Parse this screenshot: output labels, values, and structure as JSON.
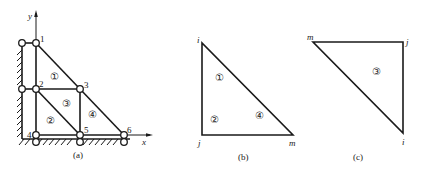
{
  "figure": {
    "panels": [
      {
        "id": "a",
        "caption": "(a)",
        "axes": {
          "x_label": "x",
          "y_label": "y"
        },
        "nodes": [
          {
            "label": "1",
            "x": 36,
            "y": 43
          },
          {
            "label": "2",
            "x": 36,
            "y": 89
          },
          {
            "label": "3",
            "x": 80,
            "y": 89
          },
          {
            "label": "4",
            "x": 36,
            "y": 135
          },
          {
            "label": "5",
            "x": 80,
            "y": 135
          },
          {
            "label": "6",
            "x": 124,
            "y": 135
          }
        ],
        "elements": [
          {
            "label": "①",
            "nodes": [
              "1",
              "2",
              "3"
            ]
          },
          {
            "label": "②",
            "nodes": [
              "2",
              "4",
              "5"
            ]
          },
          {
            "label": "③",
            "nodes": [
              "2",
              "5",
              "3"
            ]
          },
          {
            "label": "④",
            "nodes": [
              "3",
              "5",
              "6"
            ]
          }
        ],
        "supports": "left wall at nodes 1, 2; ground at nodes 4, 5, 6"
      },
      {
        "id": "b",
        "caption": "(b)",
        "vertices": {
          "i": "i",
          "j": "j",
          "m": "m"
        },
        "element_labels": [
          "①",
          "②",
          "④"
        ]
      },
      {
        "id": "c",
        "caption": "(c)",
        "vertices": {
          "i": "i",
          "j": "j",
          "m": "m"
        },
        "element_labels": [
          "③"
        ]
      }
    ]
  },
  "labels": {
    "a": {
      "caption": "(a)",
      "y": "y",
      "x": "x",
      "n1": "1",
      "n2": "2",
      "n3": "3",
      "n4": "4",
      "n5": "5",
      "n6": "6",
      "e1": "①",
      "e2": "②",
      "e3": "③",
      "e4": "④"
    },
    "b": {
      "caption": "(b)",
      "i": "i",
      "j": "j",
      "m": "m",
      "e1": "①",
      "e2": "②",
      "e4": "④"
    },
    "c": {
      "caption": "(c)",
      "i": "i",
      "j": "j",
      "m": "m",
      "e3": "③"
    }
  }
}
